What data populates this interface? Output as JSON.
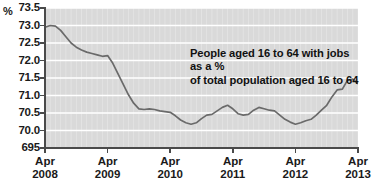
{
  "chart_data": {
    "type": "line",
    "title": "",
    "xlabel": "",
    "ylabel": "%",
    "ylim": [
      69.5,
      73.5
    ],
    "grid": true,
    "legend_position": "none",
    "y_unit_symbol": "%",
    "y_tick_labels": [
      "73.5",
      "73.0",
      "72.5",
      "72.0",
      "71.5",
      "71.0",
      "70.5",
      "70.0",
      "695"
    ],
    "y_tick_values": [
      73.5,
      73.0,
      72.5,
      72.0,
      71.5,
      71.0,
      70.5,
      70.0,
      69.5
    ],
    "x_tick_labels": [
      {
        "top": "Apr",
        "bottom": "2008"
      },
      {
        "top": "Apr",
        "bottom": "2009"
      },
      {
        "top": "Apr",
        "bottom": "2010"
      },
      {
        "top": "Apr",
        "bottom": "2011"
      },
      {
        "top": "Apr",
        "bottom": "2012"
      },
      {
        "top": "Apr",
        "bottom": "2013"
      }
    ],
    "x_tick_positions": [
      0,
      12,
      24,
      36,
      48,
      60
    ],
    "annotations": [
      {
        "line1": "People aged 16 to 64 with jobs as a %",
        "line2": "of total population aged 16 to 64"
      }
    ],
    "series": [
      {
        "name": "Employment rate, aged 16 to 64",
        "color": "#6a6a6a",
        "x": [
          0,
          1,
          2,
          3,
          4,
          5,
          6,
          7,
          8,
          9,
          10,
          11,
          12,
          13,
          14,
          15,
          16,
          17,
          18,
          19,
          20,
          21,
          22,
          23,
          24,
          25,
          26,
          27,
          28,
          29,
          30,
          31,
          32,
          33,
          34,
          35,
          36,
          37,
          38,
          39,
          40,
          41,
          42,
          43,
          44,
          45,
          46,
          47,
          48,
          49,
          50,
          51,
          52,
          53,
          54,
          55,
          56,
          57,
          58,
          59,
          60
        ],
        "values": [
          72.95,
          73.0,
          72.98,
          72.86,
          72.68,
          72.5,
          72.38,
          72.3,
          72.24,
          72.2,
          72.16,
          72.12,
          72.14,
          71.92,
          71.62,
          71.32,
          71.02,
          70.78,
          70.62,
          70.6,
          70.62,
          70.6,
          70.56,
          70.54,
          70.52,
          70.42,
          70.3,
          70.22,
          70.18,
          70.22,
          70.34,
          70.44,
          70.46,
          70.56,
          70.66,
          70.72,
          70.62,
          70.48,
          70.44,
          70.46,
          70.58,
          70.66,
          70.62,
          70.58,
          70.56,
          70.44,
          70.32,
          70.24,
          70.18,
          70.22,
          70.28,
          70.32,
          70.44,
          70.58,
          70.72,
          70.96,
          71.16,
          71.18,
          71.44,
          71.47,
          71.34
        ]
      }
    ]
  },
  "style": {
    "plot_background": "#d9d9d9",
    "gridline_color": "#ffffff",
    "axis_color": "#4a4a4a",
    "line_color": "#6a6a6a",
    "text_color": "#1a1a1a"
  }
}
